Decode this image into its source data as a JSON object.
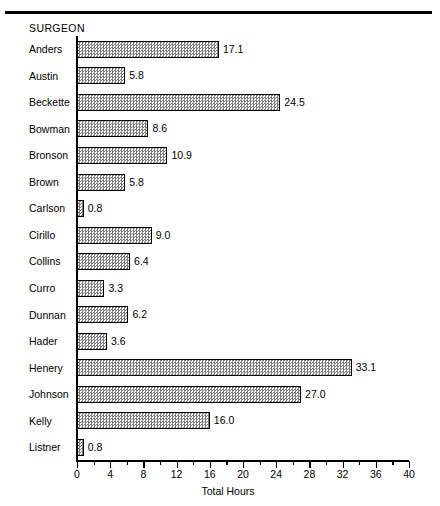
{
  "chart_data": {
    "type": "bar",
    "orientation": "horizontal",
    "title": "",
    "category_heading": "SURGEON",
    "xlabel": "Total Hours",
    "ylabel": "",
    "xlim": [
      0,
      40
    ],
    "xticks": [
      0,
      4,
      8,
      12,
      16,
      20,
      24,
      28,
      32,
      36,
      40
    ],
    "xtick_labels": [
      "0",
      "4",
      "8",
      "12",
      "16",
      "20",
      "24",
      "28",
      "32",
      "36",
      "40"
    ],
    "minor_tick_interval": 2,
    "grid": false,
    "legend": false,
    "bar_fill": "checkerboard-dither",
    "bar_edge_color": "#000000",
    "categories": [
      "Anders",
      "Austin",
      "Beckette",
      "Bowman",
      "Bronson",
      "Brown",
      "Carlson",
      "Cirillo",
      "Collins",
      "Curro",
      "Dunnan",
      "Hader",
      "Henery",
      "Johnson",
      "Kelly",
      "Listner"
    ],
    "values": [
      17.1,
      5.8,
      24.5,
      8.6,
      10.9,
      5.8,
      0.8,
      9.0,
      6.4,
      3.3,
      6.2,
      3.6,
      33.1,
      27.0,
      16.0,
      0.8
    ],
    "value_labels": [
      "17.1",
      "5.8",
      "24.5",
      "8.6",
      "10.9",
      "5.8",
      "0.8",
      "9.0",
      "6.4",
      "3.3",
      "6.2",
      "3.6",
      "33.1",
      "27.0",
      "16.0",
      "0.8"
    ]
  },
  "figure": {
    "top_rule": true,
    "background_color": "#ffffff",
    "text_color": "#000000"
  }
}
